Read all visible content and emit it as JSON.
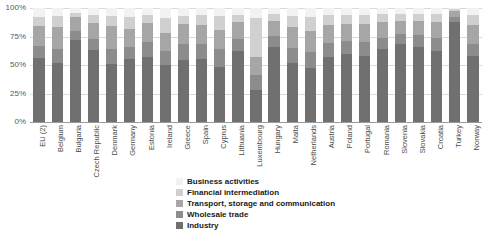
{
  "chart_data": {
    "type": "bar",
    "stacked": true,
    "stack_mode": "percent",
    "title": "",
    "xlabel": "",
    "ylabel": "",
    "ylim": [
      0,
      100
    ],
    "yticks": [
      "0%",
      "25%",
      "50%",
      "75%",
      "100%"
    ],
    "ytick_values": [
      0,
      25,
      50,
      75,
      100
    ],
    "grid": true,
    "legend_position": "bottom-center",
    "categories": [
      "EU (2)",
      "Belgium",
      "Bulgaria",
      "Czech Republic",
      "Denmark",
      "Germany",
      "Estonia",
      "Ireland",
      "Greece",
      "Spain",
      "Cyprus",
      "Lithuania",
      "Luxembourg",
      "Hungary",
      "Malta",
      "Netherlands",
      "Austria",
      "Poland",
      "Portugal",
      "Romania",
      "Slovenia",
      "Slovakia",
      "Croatia",
      "Turkey",
      "Norway"
    ],
    "series": [
      {
        "name": "Industry",
        "color": "#707070",
        "values": [
          56,
          52,
          72,
          63,
          51,
          55,
          57,
          50,
          54,
          55,
          48,
          62,
          28,
          66,
          52,
          47,
          57,
          60,
          58,
          64,
          68,
          66,
          62,
          88,
          58
        ]
      },
      {
        "name": "Wholesale trade",
        "color": "#8c8c8c",
        "values": [
          11,
          12,
          8,
          10,
          13,
          11,
          13,
          12,
          14,
          13,
          16,
          11,
          13,
          9,
          13,
          14,
          12,
          11,
          12,
          10,
          9,
          10,
          12,
          4,
          10
        ]
      },
      {
        "name": "Transport, storage and communication",
        "color": "#a6a6a6",
        "values": [
          17,
          19,
          12,
          14,
          20,
          16,
          17,
          16,
          18,
          17,
          17,
          15,
          16,
          14,
          18,
          19,
          16,
          15,
          16,
          14,
          12,
          13,
          14,
          5,
          17
        ]
      },
      {
        "name": "Financial intermediation",
        "color": "#d0d0d0",
        "values": [
          8,
          10,
          4,
          7,
          9,
          10,
          7,
          13,
          7,
          9,
          12,
          6,
          34,
          6,
          10,
          12,
          9,
          8,
          8,
          7,
          6,
          6,
          7,
          2,
          9
        ]
      },
      {
        "name": "Business activities",
        "color": "#f2f2f2",
        "values": [
          8,
          7,
          4,
          6,
          7,
          8,
          6,
          9,
          7,
          6,
          7,
          6,
          9,
          5,
          7,
          8,
          6,
          6,
          6,
          5,
          5,
          5,
          5,
          1,
          6
        ]
      }
    ]
  },
  "legend": {
    "items": [
      {
        "label": "Business activities",
        "swatch": "#f2f2f2"
      },
      {
        "label": "Financial intermediation",
        "swatch": "#d0d0d0"
      },
      {
        "label": "Transport, storage and communication",
        "swatch": "#a6a6a6"
      },
      {
        "label": "Wholesale trade",
        "swatch": "#8c8c8c"
      },
      {
        "label": "Industry",
        "swatch": "#707070"
      }
    ]
  },
  "colors": {
    "gridline": "#d9d9d9",
    "axis": "#9a9a9a",
    "tick_text": "#595959",
    "category_text": "#4a4a4a",
    "legend_text": "#1a1a1a",
    "background": "#ffffff"
  }
}
